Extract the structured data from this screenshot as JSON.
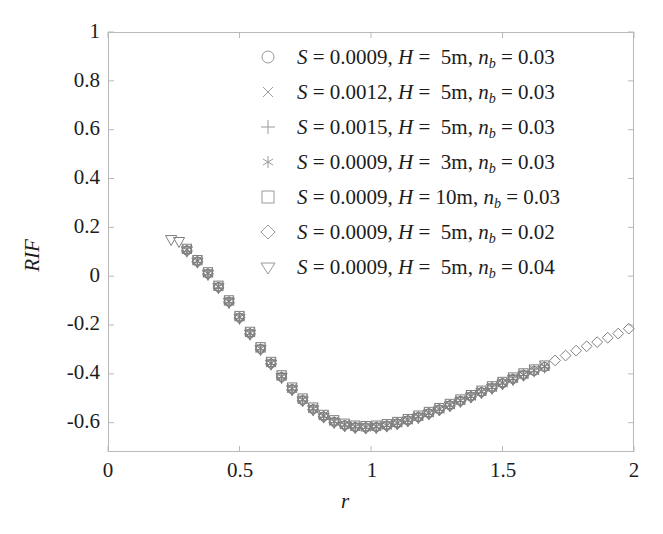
{
  "chart_data": {
    "type": "scatter",
    "title": "",
    "xlabel": "r",
    "ylabel": "RIF",
    "xlim": [
      0,
      2
    ],
    "ylim": [
      -0.72,
      1
    ],
    "xticks": [
      "0",
      "0.5",
      "1",
      "1.5",
      "2"
    ],
    "xtick_values": [
      0,
      0.5,
      1,
      1.5,
      2
    ],
    "yticks": [
      "1",
      "0.8",
      "0.6",
      "0.4",
      "0.2",
      "0",
      "-0.2",
      "-0.4",
      "-0.6"
    ],
    "ytick_values": [
      1,
      0.8,
      0.6,
      0.4,
      0.2,
      0,
      -0.2,
      -0.4,
      -0.6
    ],
    "grid": false,
    "legend_position": "upper right",
    "marker_color": "#808080",
    "series": [
      {
        "name": "S = 0.0009, H =  5m, n_b = 0.03",
        "marker": "circle",
        "S": "0.0009",
        "H": "5m",
        "n_b": "0.03",
        "x": [
          0.3,
          0.34,
          0.38,
          0.42,
          0.46,
          0.5,
          0.54,
          0.58,
          0.62,
          0.66,
          0.7,
          0.74,
          0.78,
          0.82,
          0.86,
          0.9,
          0.94,
          0.98,
          1.02,
          1.06,
          1.1,
          1.14,
          1.18,
          1.22,
          1.26,
          1.3,
          1.34,
          1.38,
          1.42,
          1.46,
          1.5,
          1.54,
          1.58,
          1.62,
          1.66
        ],
        "y": [
          0.105,
          0.06,
          0.01,
          -0.045,
          -0.105,
          -0.17,
          -0.235,
          -0.298,
          -0.358,
          -0.413,
          -0.463,
          -0.508,
          -0.545,
          -0.575,
          -0.597,
          -0.611,
          -0.618,
          -0.62,
          -0.618,
          -0.612,
          -0.603,
          -0.591,
          -0.577,
          -0.562,
          -0.546,
          -0.529,
          -0.511,
          -0.493,
          -0.475,
          -0.457,
          -0.439,
          -0.421,
          -0.404,
          -0.388,
          -0.372
        ]
      },
      {
        "name": "S = 0.0012, H =  5m, n_b = 0.03",
        "marker": "cross",
        "S": "0.0012",
        "H": "5m",
        "n_b": "0.03",
        "x": [
          0.3,
          0.34,
          0.38,
          0.42,
          0.46,
          0.5,
          0.54,
          0.58,
          0.62,
          0.66,
          0.7,
          0.74,
          0.78,
          0.82,
          0.86,
          0.9,
          0.94,
          0.98,
          1.02,
          1.06,
          1.1,
          1.14,
          1.18,
          1.22,
          1.26,
          1.3,
          1.34,
          1.38,
          1.42,
          1.46,
          1.5,
          1.54,
          1.58,
          1.62,
          1.66
        ],
        "y": [
          0.11,
          0.064,
          0.014,
          -0.041,
          -0.101,
          -0.166,
          -0.231,
          -0.294,
          -0.354,
          -0.409,
          -0.459,
          -0.504,
          -0.541,
          -0.571,
          -0.593,
          -0.607,
          -0.615,
          -0.617,
          -0.615,
          -0.609,
          -0.6,
          -0.588,
          -0.574,
          -0.559,
          -0.543,
          -0.526,
          -0.508,
          -0.49,
          -0.472,
          -0.454,
          -0.436,
          -0.418,
          -0.401,
          -0.385,
          -0.369
        ]
      },
      {
        "name": "S = 0.0015, H =  5m, n_b = 0.03",
        "marker": "plus",
        "S": "0.0015",
        "H": "5m",
        "n_b": "0.03",
        "x": [
          0.3,
          0.34,
          0.38,
          0.42,
          0.46,
          0.5,
          0.54,
          0.58,
          0.62,
          0.66,
          0.7,
          0.74,
          0.78,
          0.82,
          0.86,
          0.9,
          0.94,
          0.98,
          1.02,
          1.06,
          1.1,
          1.14,
          1.18,
          1.22,
          1.26,
          1.3,
          1.34,
          1.38,
          1.42,
          1.46,
          1.5,
          1.54,
          1.58,
          1.62,
          1.66
        ],
        "y": [
          0.1,
          0.055,
          0.005,
          -0.05,
          -0.11,
          -0.175,
          -0.24,
          -0.302,
          -0.362,
          -0.417,
          -0.467,
          -0.511,
          -0.548,
          -0.578,
          -0.6,
          -0.614,
          -0.621,
          -0.623,
          -0.621,
          -0.615,
          -0.606,
          -0.594,
          -0.58,
          -0.565,
          -0.549,
          -0.532,
          -0.514,
          -0.496,
          -0.478,
          -0.46,
          -0.442,
          -0.424,
          -0.407,
          -0.391,
          -0.375
        ]
      },
      {
        "name": "S = 0.0009, H =  3m, n_b = 0.03",
        "marker": "asterisk",
        "S": "0.0009",
        "H": "3m",
        "n_b": "0.03",
        "x": [
          0.3,
          0.34,
          0.38,
          0.42,
          0.46,
          0.5,
          0.54,
          0.58,
          0.62,
          0.66,
          0.7,
          0.74,
          0.78,
          0.82,
          0.86,
          0.9,
          0.94,
          0.98,
          1.02,
          1.06,
          1.1,
          1.14,
          1.18,
          1.22,
          1.26,
          1.3,
          1.34,
          1.38,
          1.42,
          1.46,
          1.5,
          1.54,
          1.58,
          1.62,
          1.66
        ],
        "y": [
          0.108,
          0.062,
          0.012,
          -0.043,
          -0.103,
          -0.168,
          -0.233,
          -0.296,
          -0.356,
          -0.411,
          -0.461,
          -0.506,
          -0.543,
          -0.573,
          -0.595,
          -0.609,
          -0.617,
          -0.619,
          -0.617,
          -0.611,
          -0.602,
          -0.59,
          -0.576,
          -0.561,
          -0.545,
          -0.528,
          -0.51,
          -0.492,
          -0.474,
          -0.456,
          -0.438,
          -0.42,
          -0.403,
          -0.387,
          -0.371
        ]
      },
      {
        "name": "S = 0.0009, H = 10m, n_b = 0.03",
        "marker": "square",
        "S": "0.0009",
        "H": "10m",
        "n_b": "0.03",
        "x": [
          0.3,
          0.34,
          0.38,
          0.42,
          0.46,
          0.5,
          0.54,
          0.58,
          0.62,
          0.66,
          0.7,
          0.74,
          0.78,
          0.82,
          0.86,
          0.9,
          0.94,
          0.98,
          1.02,
          1.06,
          1.1,
          1.14,
          1.18,
          1.22,
          1.26,
          1.3,
          1.34,
          1.38,
          1.42,
          1.46,
          1.5,
          1.54,
          1.58,
          1.62,
          1.66
        ],
        "y": [
          0.112,
          0.066,
          0.016,
          -0.039,
          -0.099,
          -0.163,
          -0.228,
          -0.291,
          -0.351,
          -0.406,
          -0.456,
          -0.501,
          -0.538,
          -0.568,
          -0.59,
          -0.604,
          -0.612,
          -0.614,
          -0.612,
          -0.606,
          -0.597,
          -0.585,
          -0.571,
          -0.556,
          -0.54,
          -0.523,
          -0.505,
          -0.487,
          -0.469,
          -0.451,
          -0.433,
          -0.415,
          -0.398,
          -0.382,
          -0.366
        ]
      },
      {
        "name": "S = 0.0009, H =  5m, n_b = 0.02",
        "marker": "diamond",
        "S": "0.0009",
        "H": "5m",
        "n_b": "0.02",
        "x": [
          0.3,
          0.34,
          0.38,
          0.42,
          0.46,
          0.5,
          0.54,
          0.58,
          0.62,
          0.66,
          0.7,
          0.74,
          0.78,
          0.82,
          0.86,
          0.9,
          0.94,
          0.98,
          1.02,
          1.06,
          1.1,
          1.14,
          1.18,
          1.22,
          1.26,
          1.3,
          1.34,
          1.38,
          1.42,
          1.46,
          1.5,
          1.54,
          1.58,
          1.62,
          1.66,
          1.7,
          1.74,
          1.78,
          1.82,
          1.86,
          1.9,
          1.94,
          1.98
        ],
        "y": [
          0.106,
          0.06,
          0.01,
          -0.045,
          -0.105,
          -0.17,
          -0.235,
          -0.298,
          -0.358,
          -0.413,
          -0.463,
          -0.508,
          -0.545,
          -0.575,
          -0.597,
          -0.611,
          -0.618,
          -0.62,
          -0.618,
          -0.612,
          -0.603,
          -0.591,
          -0.577,
          -0.562,
          -0.546,
          -0.529,
          -0.511,
          -0.493,
          -0.475,
          -0.457,
          -0.439,
          -0.421,
          -0.404,
          -0.388,
          -0.372,
          -0.345,
          -0.325,
          -0.305,
          -0.287,
          -0.27,
          -0.252,
          -0.235,
          -0.215
        ]
      },
      {
        "name": "S = 0.0009, H =  5m, n_b = 0.04",
        "marker": "triangle-down",
        "S": "0.0009",
        "H": "5m",
        "n_b": "0.04",
        "x": [
          0.24,
          0.27,
          0.3,
          0.34,
          0.38,
          0.42,
          0.46,
          0.5,
          0.54,
          0.58,
          0.62,
          0.66,
          0.7,
          0.74,
          0.78,
          0.82,
          0.86,
          0.9,
          0.94,
          0.98,
          1.02,
          1.06,
          1.1,
          1.14,
          1.18,
          1.22,
          1.26,
          1.3,
          1.34,
          1.38,
          1.42,
          1.46,
          1.5,
          1.54,
          1.58
        ],
        "y": [
          0.15,
          0.142,
          0.104,
          0.058,
          0.008,
          -0.047,
          -0.107,
          -0.172,
          -0.237,
          -0.3,
          -0.36,
          -0.415,
          -0.465,
          -0.51,
          -0.547,
          -0.577,
          -0.599,
          -0.613,
          -0.62,
          -0.622,
          -0.62,
          -0.614,
          -0.605,
          -0.593,
          -0.579,
          -0.564,
          -0.548,
          -0.531,
          -0.513,
          -0.495,
          -0.477,
          -0.459,
          -0.441,
          -0.423,
          -0.406
        ]
      }
    ]
  },
  "legend": {
    "entries": [
      {
        "marker": "circle",
        "S": "0.0009",
        "H": " 5m",
        "nb": "0.03"
      },
      {
        "marker": "cross",
        "S": "0.0012",
        "H": " 5m",
        "nb": "0.03"
      },
      {
        "marker": "plus",
        "S": "0.0015",
        "H": " 5m",
        "nb": "0.03"
      },
      {
        "marker": "asterisk",
        "S": "0.0009",
        "H": " 3m",
        "nb": "0.03"
      },
      {
        "marker": "square",
        "S": "0.0009",
        "H": "10m",
        "nb": "0.03"
      },
      {
        "marker": "diamond",
        "S": "0.0009",
        "H": " 5m",
        "nb": "0.02"
      },
      {
        "marker": "triangle-down",
        "S": "0.0009",
        "H": " 5m",
        "nb": "0.04"
      }
    ],
    "symbol_S": "S",
    "symbol_H": "H",
    "symbol_n": "n",
    "symbol_nsub": "b",
    "equals": "=",
    "comma": ","
  }
}
